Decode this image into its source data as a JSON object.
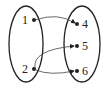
{
  "diagram": {
    "type": "mapping-diagram",
    "domain": {
      "elements": [
        {
          "label": "1",
          "x": 34,
          "y": 20,
          "lx": 20,
          "ly": 24
        },
        {
          "label": "2",
          "x": 34,
          "y": 69,
          "lx": 20,
          "ly": 73
        }
      ]
    },
    "range": {
      "elements": [
        {
          "label": "4",
          "x": 77,
          "y": 24,
          "lx": 82,
          "ly": 28
        },
        {
          "label": "5",
          "x": 77,
          "y": 46,
          "lx": 82,
          "ly": 50
        },
        {
          "label": "6",
          "x": 77,
          "y": 71,
          "lx": 82,
          "ly": 75
        }
      ]
    },
    "mappings": [
      {
        "from": "1",
        "to": "4"
      },
      {
        "from": "2",
        "to": "5"
      },
      {
        "from": "2",
        "to": "6"
      }
    ],
    "colors": {
      "stroke": "#222222",
      "background": "#ffffff"
    }
  }
}
